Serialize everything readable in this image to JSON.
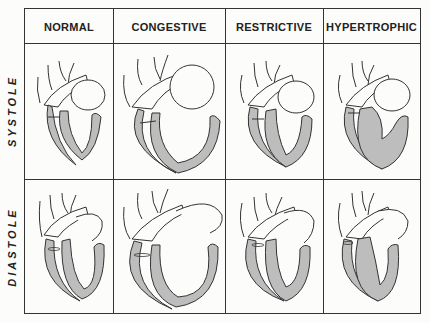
{
  "columns": [
    {
      "label": "NORMAL",
      "key": "normal"
    },
    {
      "label": "CONGESTIVE",
      "key": "congestive"
    },
    {
      "label": "RESTRICTIVE",
      "key": "restrictive"
    },
    {
      "label": "HYPERTROPHIC",
      "key": "hypertrophic"
    }
  ],
  "rows": [
    {
      "label": "SYSTOLE",
      "key": "systole"
    },
    {
      "label": "DIASTOLE",
      "key": "diastole"
    }
  ],
  "colors": {
    "line": "#333333",
    "myocardium_fill": "#bdbdbd",
    "background": "#fcfcfa"
  }
}
